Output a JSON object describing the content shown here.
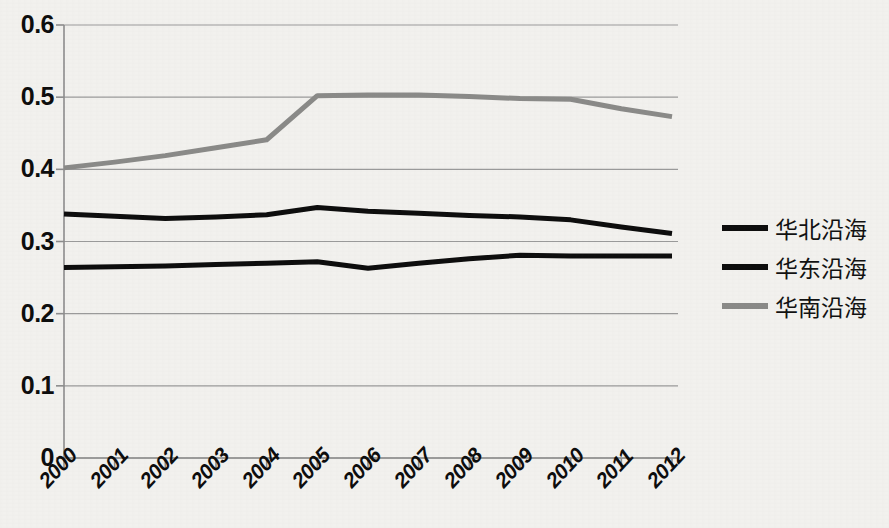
{
  "chart_data": {
    "type": "line",
    "title": "",
    "xlabel": "",
    "ylabel": "",
    "categories": [
      "2000",
      "2001",
      "2002",
      "2003",
      "2004",
      "2005",
      "2006",
      "2007",
      "2008",
      "2009",
      "2010",
      "2011",
      "2012"
    ],
    "ylim": [
      0,
      0.6
    ],
    "ytick_labels": [
      "0",
      "0.1",
      "0.2",
      "0.3",
      "0.4",
      "0.5",
      "0.6"
    ],
    "ytick_values": [
      0,
      0.1,
      0.2,
      0.3,
      0.4,
      0.5,
      0.6
    ],
    "grid": true,
    "legend_position": "right",
    "series": [
      {
        "name": "华北沿海",
        "color": "#0d0d0d",
        "width": 5,
        "values": [
          0.338,
          0.335,
          0.332,
          0.334,
          0.337,
          0.347,
          0.342,
          0.339,
          0.336,
          0.334,
          0.33,
          0.32,
          0.311
        ]
      },
      {
        "name": "华东沿海",
        "color": "#0d0d0d",
        "width": 5,
        "values": [
          0.264,
          0.265,
          0.266,
          0.268,
          0.27,
          0.272,
          0.263,
          0.27,
          0.276,
          0.281,
          0.28,
          0.28,
          0.28
        ]
      },
      {
        "name": "华南沿海",
        "color": "#8a8a88",
        "width": 5,
        "values": [
          0.402,
          0.41,
          0.419,
          0.43,
          0.441,
          0.502,
          0.503,
          0.503,
          0.501,
          0.498,
          0.497,
          0.484,
          0.473
        ]
      }
    ]
  },
  "legend": {
    "items": [
      {
        "label": "华北沿海",
        "color": "#0d0d0d"
      },
      {
        "label": "华东沿海",
        "color": "#0d0d0d"
      },
      {
        "label": "华南沿海",
        "color": "#8a8a88"
      }
    ]
  },
  "axis": {
    "axis_color": "#8c8c8c",
    "grid_color": "#9a9a9a"
  }
}
